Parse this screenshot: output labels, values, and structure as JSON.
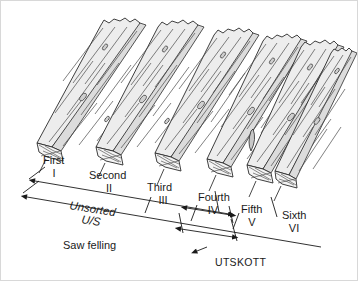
{
  "figure": {
    "background_color": "#ffffff",
    "line_color": "#1a1a1a",
    "board_face_color": "#ececec",
    "board_top_color": "#e4e4e4",
    "board_end_color": "#f2f2f2"
  },
  "boards": [
    {
      "grade_name": "First",
      "grade_numeral": "I"
    },
    {
      "grade_name": "Second",
      "grade_numeral": "II"
    },
    {
      "grade_name": "Third",
      "grade_numeral": "III"
    },
    {
      "grade_name": "Fourth",
      "grade_numeral": "IV"
    },
    {
      "grade_name": "Fifth",
      "grade_numeral": "V"
    },
    {
      "grade_name": "Sixth",
      "grade_numeral": "VI"
    }
  ],
  "brackets": {
    "unsorted_label": "Unsorted",
    "unsorted_abbrev": "U/S",
    "saw_felling_label": "Saw felling",
    "utskott_label": "UTSKOTT"
  }
}
